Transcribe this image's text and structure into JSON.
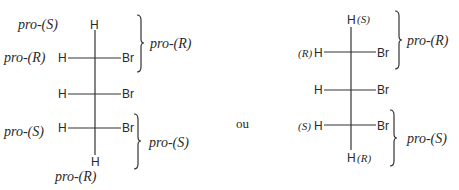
{
  "left": {
    "top_label": "pro-(S)",
    "top_atom": "H",
    "rows": [
      {
        "left_label": "pro-(R)",
        "left_atom": "H",
        "right_atom": "Br"
      },
      {
        "left_label": "",
        "left_atom": "H",
        "right_atom": "Br"
      },
      {
        "left_label": "pro-(S)",
        "left_atom": "H",
        "right_atom": "Br"
      }
    ],
    "bottom_atom": "H",
    "bottom_label": "pro-(R)",
    "brace_upper_label": "pro-(R)",
    "brace_lower_label": "pro-(S)"
  },
  "separator": "ou",
  "right": {
    "top_atom": "H",
    "top_label": "(S)",
    "rows": [
      {
        "left_label": "(R)",
        "left_atom": "H",
        "right_atom": "Br"
      },
      {
        "left_label": "",
        "left_atom": "H",
        "right_atom": "Br"
      },
      {
        "left_label": "(S)",
        "left_atom": "H",
        "right_atom": "Br"
      }
    ],
    "bottom_atom": "H",
    "bottom_label": "(R)",
    "brace_upper_label": "pro-(R)",
    "brace_lower_label": "pro-(S)"
  }
}
